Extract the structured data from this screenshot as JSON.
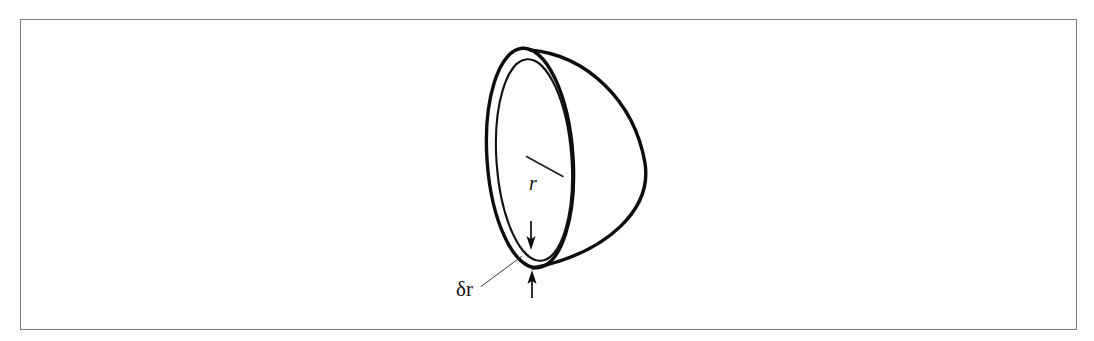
{
  "figure": {
    "caption_present": false,
    "background_color": "#ffffff",
    "frame": {
      "color": "#7c7c7c",
      "x": 20,
      "y": 19,
      "width": 1057,
      "height": 311
    },
    "labels": {
      "radius": "r",
      "thickness": "δr"
    },
    "ink_color": "#0d0d0d"
  },
  "chart_data": {
    "type": "diagram",
    "title": "",
    "annotations": [
      {
        "text": "r",
        "role": "radius-label",
        "x": 540,
        "y": 182,
        "italic": true
      },
      {
        "text": "δr",
        "role": "thickness-label",
        "x": 459,
        "y": 293,
        "italic": false
      }
    ],
    "elements": [
      {
        "name": "outer-rim-ellipse",
        "kind": "ellipse",
        "cx": 530,
        "cy": 158,
        "rx": 43,
        "ry": 110,
        "rotation_deg": -4
      },
      {
        "name": "inner-rim-ellipse",
        "kind": "ellipse",
        "cx": 534,
        "cy": 160,
        "rx": 38,
        "ry": 102,
        "rotation_deg": -4
      },
      {
        "name": "hemisphere-bulge-arc",
        "kind": "arc",
        "from": [
          530,
          50
        ],
        "to": [
          533,
          268
        ],
        "bulge_x": 646
      },
      {
        "name": "radius-line",
        "kind": "line",
        "from": [
          527,
          157
        ],
        "to": [
          563,
          176
        ]
      },
      {
        "name": "thickness-arrow-down",
        "kind": "arrow",
        "from": [
          531,
          222
        ],
        "to": [
          531,
          249
        ],
        "direction": "down"
      },
      {
        "name": "thickness-arrow-up",
        "kind": "arrow",
        "from": [
          532,
          297
        ],
        "to": [
          532,
          271
        ],
        "direction": "up"
      },
      {
        "name": "thickness-leader-line",
        "kind": "line",
        "from": [
          481,
          286
        ],
        "to": [
          521,
          257
        ]
      }
    ],
    "axis": {
      "show": false
    },
    "legend": {
      "show": false
    },
    "grid": false
  }
}
